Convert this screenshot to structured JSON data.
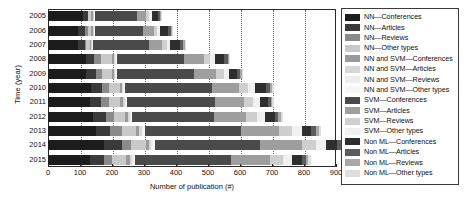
{
  "chart_data": {
    "type": "bar",
    "orientation": "horizontal",
    "stacked": true,
    "title": "",
    "xlabel": "Number of publication (#)",
    "ylabel": "Time (year)",
    "xlim": [
      0,
      900
    ],
    "ylim_categories": [
      "2005",
      "2006",
      "2007",
      "2008",
      "2009",
      "2010",
      "2011",
      "2012",
      "2013",
      "2014",
      "2015"
    ],
    "xticks": [
      0,
      100,
      200,
      300,
      400,
      500,
      600,
      700,
      800,
      900
    ],
    "grid": "vertical-dotted",
    "legend_position": "right-outside",
    "categories": [
      "2005",
      "2006",
      "2007",
      "2008",
      "2009",
      "2010",
      "2011",
      "2012",
      "2013",
      "2014",
      "2015"
    ],
    "series": [
      {
        "name": "NN—Conferences",
        "color": "#1c1c1c",
        "values": [
          110,
          95,
          95,
          120,
          120,
          135,
          130,
          140,
          150,
          175,
          130
        ]
      },
      {
        "name": "NN—Articles",
        "color": "#3a3a3a",
        "values": [
          15,
          20,
          20,
          25,
          30,
          35,
          35,
          40,
          45,
          55,
          45
        ]
      },
      {
        "name": "NN—Reviews",
        "color": "#8a8a8a",
        "values": [
          0,
          10,
          5,
          20,
          20,
          20,
          25,
          25,
          35,
          30,
          25
        ]
      },
      {
        "name": "NN—Other types",
        "color": "#c9c9c9",
        "values": [
          10,
          10,
          10,
          35,
          30,
          35,
          35,
          35,
          45,
          45,
          45
        ]
      },
      {
        "name": "NN and SVM—Conferences",
        "color": "#9a9a9a",
        "values": [
          5,
          5,
          5,
          5,
          5,
          5,
          10,
          10,
          10,
          10,
          10
        ]
      },
      {
        "name": "NN and SVM—Articles",
        "color": "#d7d7d7",
        "values": [
          3,
          3,
          3,
          5,
          5,
          5,
          5,
          5,
          8,
          8,
          8
        ]
      },
      {
        "name": "NN and SVM—Reviews",
        "color": "#ededed",
        "values": [
          2,
          2,
          2,
          3,
          3,
          3,
          3,
          5,
          5,
          5,
          5
        ]
      },
      {
        "name": "NN and SVM—Other types",
        "color": "#f7f7f7",
        "values": [
          2,
          2,
          2,
          3,
          3,
          3,
          3,
          3,
          5,
          5,
          5
        ]
      },
      {
        "name": "SVM—Conferences",
        "color": "#4a4a4a",
        "values": [
          130,
          150,
          175,
          210,
          240,
          270,
          275,
          255,
          300,
          330,
          300
        ]
      },
      {
        "name": "SVM—Articles",
        "color": "#9e9e9e",
        "values": [
          30,
          35,
          40,
          60,
          70,
          85,
          90,
          100,
          120,
          130,
          120
        ]
      },
      {
        "name": "SVM—Reviews",
        "color": "#cfcfcf",
        "values": [
          10,
          10,
          15,
          20,
          25,
          30,
          30,
          35,
          40,
          45,
          40
        ]
      },
      {
        "name": "SVM—Other types",
        "color": "#f0f0f0",
        "values": [
          8,
          8,
          10,
          15,
          15,
          20,
          20,
          25,
          30,
          30,
          30
        ]
      },
      {
        "name": "Non ML—Conferences",
        "color": "#2e2e2e",
        "values": [
          20,
          25,
          30,
          30,
          25,
          35,
          25,
          30,
          30,
          35,
          30
        ]
      },
      {
        "name": "Non ML—Articles",
        "color": "#5c5c5c",
        "values": [
          5,
          8,
          10,
          10,
          10,
          12,
          10,
          12,
          15,
          15,
          12
        ]
      },
      {
        "name": "Non ML—Reviews",
        "color": "#a8a8a8",
        "values": [
          3,
          3,
          5,
          5,
          5,
          8,
          5,
          8,
          8,
          10,
          8
        ]
      },
      {
        "name": "Non ML—Other types",
        "color": "#dedede",
        "values": [
          2,
          2,
          3,
          3,
          3,
          5,
          5,
          5,
          8,
          20,
          8
        ]
      }
    ],
    "totals": [
      355,
      388,
      430,
      569,
      609,
      706,
      711,
      733,
      854,
      948,
      821
    ]
  },
  "legend": {
    "items": [
      {
        "label": "NN—Conferences",
        "color": "#1c1c1c"
      },
      {
        "label": "NN—Articles",
        "color": "#3a3a3a"
      },
      {
        "label": "NN—Reviews",
        "color": "#8a8a8a"
      },
      {
        "label": "NN—Other types",
        "color": "#c9c9c9"
      },
      {
        "label": "NN and SVM—Conferences",
        "color": "#9a9a9a"
      },
      {
        "label": "NN and SVM—Articles",
        "color": "#d7d7d7"
      },
      {
        "label": "NN and SVM—Reviews",
        "color": "#ededed"
      },
      {
        "label": "NN and SVM—Other types",
        "color": "#f7f7f7"
      },
      {
        "label": "SVM—Conferences",
        "color": "#4a4a4a"
      },
      {
        "label": "SVM—Articles",
        "color": "#9e9e9e"
      },
      {
        "label": "SVM—Reviews",
        "color": "#cfcfcf"
      },
      {
        "label": "SVM—Other types",
        "color": "#f0f0f0"
      },
      {
        "label": "Non ML—Conferences",
        "color": "#2e2e2e"
      },
      {
        "label": "Non ML—Articles",
        "color": "#5c5c5c"
      },
      {
        "label": "Non ML—Reviews",
        "color": "#a8a8a8"
      },
      {
        "label": "Non ML—Other types",
        "color": "#dedede"
      }
    ]
  }
}
